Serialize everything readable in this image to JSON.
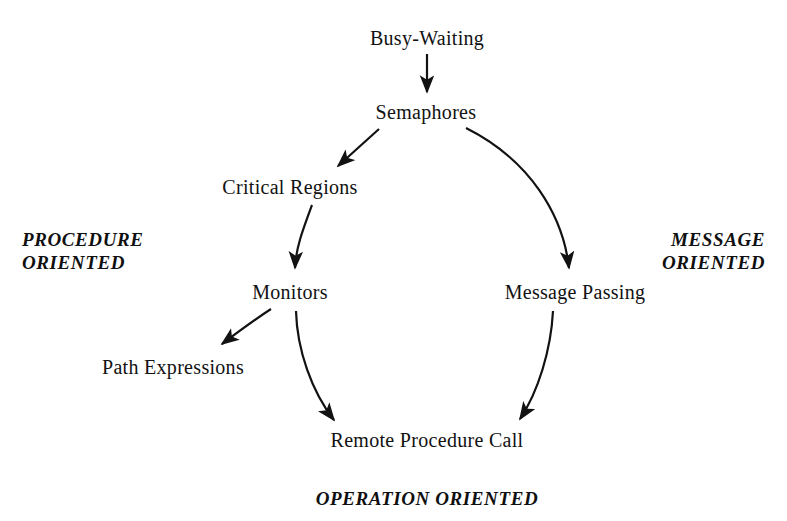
{
  "diagram": {
    "background_color": "#ffffff",
    "ink_color": "#121212",
    "nodes": [
      {
        "id": "busy_waiting",
        "label": "Busy-Waiting",
        "x": 427,
        "y": 38
      },
      {
        "id": "semaphores",
        "label": "Semaphores",
        "x": 426,
        "y": 112
      },
      {
        "id": "critical",
        "label": "Critical Regions",
        "x": 290,
        "y": 187
      },
      {
        "id": "monitors",
        "label": "Monitors",
        "x": 290,
        "y": 292
      },
      {
        "id": "message",
        "label": "Message Passing",
        "x": 575,
        "y": 292
      },
      {
        "id": "path_expr",
        "label": "Path Expressions",
        "x": 173,
        "y": 367
      },
      {
        "id": "rpc",
        "label": "Remote Procedure Call",
        "x": 427,
        "y": 440
      }
    ],
    "edges": [
      {
        "id": "busy-to-semaphores",
        "from": "busy_waiting",
        "to": "semaphores",
        "style": "straight"
      },
      {
        "id": "semaphores-to-critical",
        "from": "semaphores",
        "to": "critical",
        "style": "straight"
      },
      {
        "id": "semaphores-to-message",
        "from": "semaphores",
        "to": "message",
        "style": "curved"
      },
      {
        "id": "critical-to-monitors",
        "from": "critical",
        "to": "monitors",
        "style": "curved"
      },
      {
        "id": "monitors-to-path",
        "from": "monitors",
        "to": "path_expr",
        "style": "curved"
      },
      {
        "id": "monitors-to-rpc",
        "from": "monitors",
        "to": "rpc",
        "style": "curved"
      },
      {
        "id": "message-to-rpc",
        "from": "message",
        "to": "rpc",
        "style": "curved"
      }
    ],
    "categories": [
      {
        "id": "procedure",
        "line1": "PROCEDURE",
        "line2": "ORIENTED",
        "x": 22,
        "y": 228,
        "align": "left"
      },
      {
        "id": "message",
        "line1": "MESSAGE",
        "line2": "ORIENTED",
        "x": 765,
        "y": 228,
        "align": "right"
      },
      {
        "id": "operation",
        "line1": "OPERATION ORIENTED",
        "line2": "",
        "x": 427,
        "y": 487,
        "align": "center"
      }
    ]
  }
}
